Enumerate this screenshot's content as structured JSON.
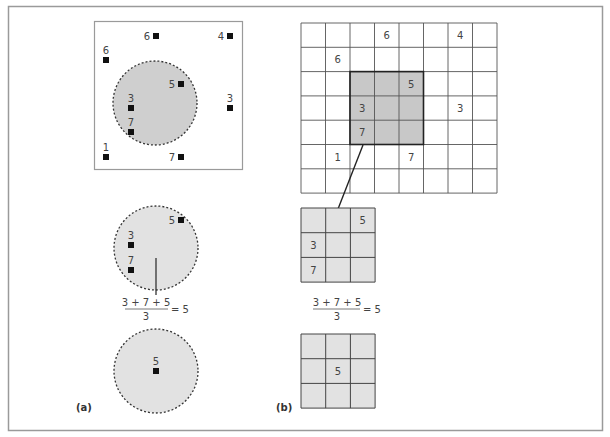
{
  "colors": {
    "frame": "#9a9a9a",
    "grid_line": "#444444",
    "shade_dark": "#c8c8c8",
    "shade_light": "#e2e2e2",
    "point": "#111111",
    "text": "#444444"
  },
  "panel_a": {
    "label": "(a)",
    "top": {
      "points": [
        {
          "value": "6",
          "x": 156,
          "y": 36,
          "label_pos": "left"
        },
        {
          "value": "4",
          "x": 230,
          "y": 36,
          "label_pos": "left"
        },
        {
          "value": "6",
          "x": 106,
          "y": 60,
          "label_pos": "above"
        },
        {
          "value": "5",
          "x": 181,
          "y": 84,
          "label_pos": "left"
        },
        {
          "value": "3",
          "x": 131,
          "y": 108,
          "label_pos": "above"
        },
        {
          "value": "3",
          "x": 230,
          "y": 108,
          "label_pos": "above"
        },
        {
          "value": "7",
          "x": 131,
          "y": 132,
          "label_pos": "above"
        },
        {
          "value": "1",
          "x": 106,
          "y": 157,
          "label_pos": "above"
        },
        {
          "value": "7",
          "x": 181,
          "y": 157,
          "label_pos": "left"
        }
      ]
    },
    "middle": {
      "points": [
        {
          "value": "5",
          "x": 181,
          "y": 220,
          "label_pos": "left"
        },
        {
          "value": "3",
          "x": 131,
          "y": 245,
          "label_pos": "above"
        },
        {
          "value": "7",
          "x": 131,
          "y": 270,
          "label_pos": "above"
        }
      ],
      "formula": {
        "numerator": "3 + 7 + 5",
        "denominator": "3",
        "result": "= 5"
      }
    },
    "bottom": {
      "points": [
        {
          "value": "5",
          "x": 156,
          "y": 371,
          "label_pos": "above"
        }
      ]
    }
  },
  "panel_b": {
    "label": "(b)",
    "grid": {
      "cols": 8,
      "rows": 7,
      "cells": [
        {
          "value": "6",
          "col": 3,
          "row": 0
        },
        {
          "value": "4",
          "col": 6,
          "row": 0
        },
        {
          "value": "6",
          "col": 1,
          "row": 1
        },
        {
          "value": "5",
          "col": 4,
          "row": 2
        },
        {
          "value": "3",
          "col": 2,
          "row": 3
        },
        {
          "value": "3",
          "col": 6,
          "row": 3
        },
        {
          "value": "7",
          "col": 2,
          "row": 4
        },
        {
          "value": "1",
          "col": 1,
          "row": 5
        },
        {
          "value": "7",
          "col": 4,
          "row": 5
        }
      ],
      "window": {
        "col": 2,
        "row": 2,
        "size": 3
      }
    },
    "window_detail": {
      "cells": [
        {
          "value": "5",
          "col": 2,
          "row": 0
        },
        {
          "value": "3",
          "col": 0,
          "row": 1
        },
        {
          "value": "7",
          "col": 0,
          "row": 2
        }
      ],
      "formula": {
        "numerator": "3 + 7 + 5",
        "denominator": "3",
        "result": "= 5"
      }
    },
    "result_window": {
      "cells": [
        {
          "value": "5",
          "col": 1,
          "row": 1
        }
      ]
    }
  }
}
